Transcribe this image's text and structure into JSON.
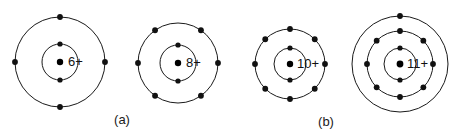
{
  "figure": {
    "background_color": "#ffffff",
    "stroke_color": "#1a1a1a",
    "electron_color": "#111111",
    "width": 459,
    "height": 137
  },
  "atoms": [
    {
      "id": "carbon",
      "nucleus_label": "6+",
      "nucleus_charge": 6,
      "center": {
        "x": 60,
        "y": 62
      },
      "nucleus_dot_radius": 3.2,
      "label_offset": {
        "x": 8,
        "y": 1
      },
      "shells": [
        {
          "name": "inner-shell",
          "radius": 18,
          "electron_count": 2,
          "electron_angles": [
            -90,
            90
          ],
          "electron_dot_radius": 2.6
        },
        {
          "name": "outer-shell",
          "radius": 45,
          "electron_count": 4,
          "electron_angles": [
            -90,
            0,
            90,
            180
          ],
          "electron_dot_radius": 2.9
        }
      ]
    },
    {
      "id": "oxygen",
      "nucleus_label": "8+",
      "nucleus_charge": 8,
      "center": {
        "x": 178,
        "y": 63
      },
      "nucleus_dot_radius": 3.2,
      "label_offset": {
        "x": 8,
        "y": 1
      },
      "shells": [
        {
          "name": "inner-shell",
          "radius": 18,
          "electron_count": 2,
          "electron_angles": [
            -90,
            90
          ],
          "electron_dot_radius": 2.6
        },
        {
          "name": "outer-shell",
          "radius": 40,
          "electron_count": 6,
          "electron_angles": [
            -125,
            -55,
            0,
            55,
            125,
            180
          ],
          "electron_dot_radius": 2.9
        }
      ]
    },
    {
      "id": "neon",
      "nucleus_label": "10+",
      "nucleus_charge": 10,
      "center": {
        "x": 290,
        "y": 64
      },
      "nucleus_dot_radius": 3.2,
      "label_offset": {
        "x": 7,
        "y": 1
      },
      "shells": [
        {
          "name": "inner-shell",
          "radius": 16,
          "electron_count": 2,
          "electron_angles": [
            -90,
            90
          ],
          "electron_dot_radius": 2.6
        },
        {
          "name": "outer-shell",
          "radius": 35,
          "electron_count": 8,
          "electron_angles": [
            -90,
            -45,
            0,
            45,
            90,
            135,
            180,
            225
          ],
          "electron_dot_radius": 2.9
        }
      ]
    },
    {
      "id": "sodium",
      "nucleus_label": "11+",
      "nucleus_charge": 11,
      "center": {
        "x": 400,
        "y": 64
      },
      "nucleus_dot_radius": 3.4,
      "label_offset": {
        "x": 7,
        "y": 1
      },
      "shells": [
        {
          "name": "inner-shell",
          "radius": 16,
          "electron_count": 2,
          "electron_angles": [
            -90,
            90
          ],
          "electron_dot_radius": 2.6
        },
        {
          "name": "middle-shell",
          "radius": 33,
          "electron_count": 8,
          "electron_angles": [
            -90,
            -45,
            0,
            45,
            90,
            135,
            180,
            225
          ],
          "electron_dot_radius": 2.9
        },
        {
          "name": "outer-shell",
          "radius": 48,
          "electron_count": 1,
          "electron_angles": [
            -90
          ],
          "electron_dot_radius": 2.9
        }
      ]
    }
  ],
  "captions": [
    {
      "id": "caption-a",
      "text": "(a)",
      "x": 122,
      "y": 121
    },
    {
      "id": "caption-b",
      "text": "(b)",
      "x": 326,
      "y": 123
    }
  ]
}
